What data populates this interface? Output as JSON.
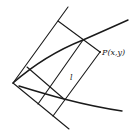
{
  "figure": {
    "labels": {
      "point": "P(x,y)",
      "length": "l"
    },
    "colors": {
      "ink": "#1a1a1a",
      "background": "#ffffff"
    },
    "geometry": {
      "origin": [
        13,
        83
      ],
      "upper_curve": "M13,83 Q45,55 83,40 Q108,29 128,20",
      "lower_curve": "M19,86 Q45,94 64,99 Q95,107 122,111",
      "lines": [
        {
          "name": "upper-axis-line",
          "x1": 13,
          "y1": 83,
          "x2": 68,
          "y2": 7
        },
        {
          "name": "lower-axis-line",
          "x1": 13,
          "y1": 83,
          "x2": 69,
          "y2": 129
        },
        {
          "name": "top-cross-line",
          "x1": 58,
          "y1": 21,
          "x2": 100,
          "y2": 52
        },
        {
          "name": "bottom-cross-line",
          "x1": 27,
          "y1": 67,
          "x2": 64,
          "y2": 99
        },
        {
          "name": "right-parallel-line",
          "x1": 100,
          "y1": 52,
          "x2": 53,
          "y2": 116
        },
        {
          "name": "left-parallel-line",
          "x1": 83,
          "y1": 40,
          "x2": 38,
          "y2": 104
        }
      ],
      "point_p": [
        100,
        52
      ]
    }
  }
}
